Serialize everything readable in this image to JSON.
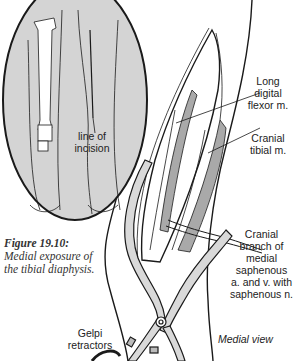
{
  "figure": {
    "number": "Figure 19.10:",
    "caption": "Medial exposure of the tibial diaphysis.",
    "view": "Medial view"
  },
  "inset": {
    "label": "line of\nincision"
  },
  "labels": {
    "long_digital_flexor": "Long\ndigital\nflexor m.",
    "cranial_tibial": "Cranial\ntibial m.",
    "cranial_branch": "Cranial\nbranch of\nmedial\nsaphenous\na. and v. with\nsaphenous n.",
    "gelpi": "Gelpi\nretractors"
  },
  "colors": {
    "line": "#1a1a1a",
    "inset_fill": "#d4d4d4",
    "muscle_fill": "#a9a9a9",
    "retractor_fill": "#d9d9d9",
    "background": "#ffffff"
  }
}
